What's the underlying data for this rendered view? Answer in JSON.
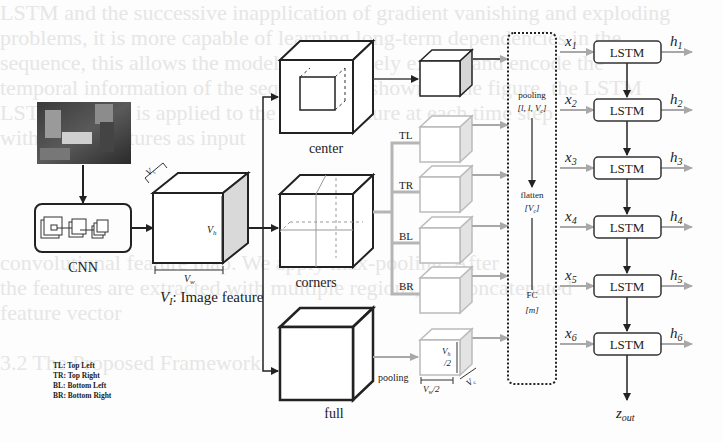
{
  "background_text_lines": [
    "LSTM and the successive inapplication of gradient vanishing and exploding",
    "problems, it is more capable of learning long-term dependencies in the",
    "sequence, this allows the model to effectively extract and encode the",
    "temporal information of the sequence. As shown in the figure, the LSTM",
    "LSTM module is applied to the visual feature at each time step",
    "with frame features as input",
    "",
    "",
    "",
    "",
    "convolutional feature map. We apply max-pooling. After",
    "the features are extracted with multiple regions, the concatenated",
    "feature vector",
    "",
    "",
    "3.2 The Proposed Framework"
  ],
  "input": {
    "name": "input-image"
  },
  "cnn": {
    "label": "CNN"
  },
  "image_feature": {
    "label_var": "V",
    "label_sub": "I",
    "label_text": ": Image feature",
    "dim_c": "V",
    "dim_c_sub": "c",
    "dim_h": "V",
    "dim_h_sub": "h",
    "dim_w": "V",
    "dim_w_sub": "w"
  },
  "regions": {
    "center": "center",
    "corners": "corners",
    "full": "full"
  },
  "corner_labels": [
    "TL",
    "TR",
    "BL",
    "BR"
  ],
  "pooled_full": {
    "pooling_label": "pooling",
    "h_label": "V",
    "h_sub": "h",
    "h_div": "/2",
    "w_label": "V",
    "w_sub": "w",
    "w_div": "/2",
    "c_label": "V",
    "c_sub": "c"
  },
  "legend": [
    "TL: Top Left",
    "TR: Top Right",
    "BL: Bottom Left",
    "BR: Bottom Right"
  ],
  "processing_box": {
    "step1": "pooling",
    "step1_dims": "[l, l, V",
    "step1_dims_sub": "c",
    "step1_dims_end": "]",
    "step2": "flatten",
    "step2_dims": "[V",
    "step2_dims_sub": "c",
    "step2_dims_end": "]",
    "step3": "FC",
    "step3_dims": "[m]"
  },
  "lstm": {
    "cell_label": "LSTM",
    "inputs": [
      {
        "var": "x",
        "sub": "1"
      },
      {
        "var": "x",
        "sub": "2"
      },
      {
        "var": "x",
        "sub": "3"
      },
      {
        "var": "x",
        "sub": "4"
      },
      {
        "var": "x",
        "sub": "5"
      },
      {
        "var": "x",
        "sub": "6"
      }
    ],
    "outputs": [
      {
        "var": "h",
        "sub": "1"
      },
      {
        "var": "h",
        "sub": "2"
      },
      {
        "var": "h",
        "sub": "3"
      },
      {
        "var": "h",
        "sub": "4"
      },
      {
        "var": "h",
        "sub": "5"
      },
      {
        "var": "h",
        "sub": "6"
      }
    ],
    "final_output": {
      "var": "z",
      "sub": "out"
    }
  },
  "colors": {
    "stroke": "#222222",
    "gray_stroke": "#b8b8b8",
    "gray_arrow": "#a8a8a8",
    "side_fill": "#d9d9d9",
    "background": "#fdfdfd",
    "bg_text": "#e6e6e6"
  }
}
